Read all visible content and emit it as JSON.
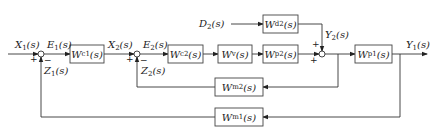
{
  "diagram": {
    "type": "cascade-control-block-diagram",
    "signals": {
      "X1": {
        "base": "X",
        "sub": "1",
        "arg": "(s)"
      },
      "E1": {
        "base": "E",
        "sub": "1",
        "arg": "(s)"
      },
      "Z1": {
        "base": "Z",
        "sub": "1",
        "arg": "(s)"
      },
      "X2": {
        "base": "X",
        "sub": "2",
        "arg": "(s)"
      },
      "E2": {
        "base": "E",
        "sub": "2",
        "arg": "(s)"
      },
      "Z2": {
        "base": "Z",
        "sub": "2",
        "arg": "(s)"
      },
      "D2": {
        "base": "D",
        "sub": "2",
        "arg": "(s)"
      },
      "Y2": {
        "base": "Y",
        "sub": "2",
        "arg": "(s)"
      },
      "Y1": {
        "base": "Y",
        "sub": "1",
        "arg": "(s)"
      }
    },
    "blocks": {
      "Wc1": {
        "base": "W",
        "sub": "c1",
        "arg": "(s)"
      },
      "Wc2": {
        "base": "W",
        "sub": "c2",
        "arg": "(s)"
      },
      "Wv": {
        "base": "W",
        "sub": "v",
        "arg": "(s)"
      },
      "Wp2": {
        "base": "W",
        "sub": "p2",
        "arg": "(s)"
      },
      "Wd2": {
        "base": "W",
        "sub": "d2",
        "arg": "(s)"
      },
      "Wp1": {
        "base": "W",
        "sub": "p1",
        "arg": "(s)"
      },
      "Wm2": {
        "base": "W",
        "sub": "m2",
        "arg": "(s)"
      },
      "Wm1": {
        "base": "W",
        "sub": "m1",
        "arg": "(s)"
      }
    },
    "signs": {
      "sum1_in": "+",
      "sum1_fb": "−",
      "sum2_in": "+",
      "sum2_fb": "−",
      "sum3_top": "+",
      "sum3_left": "+"
    }
  }
}
